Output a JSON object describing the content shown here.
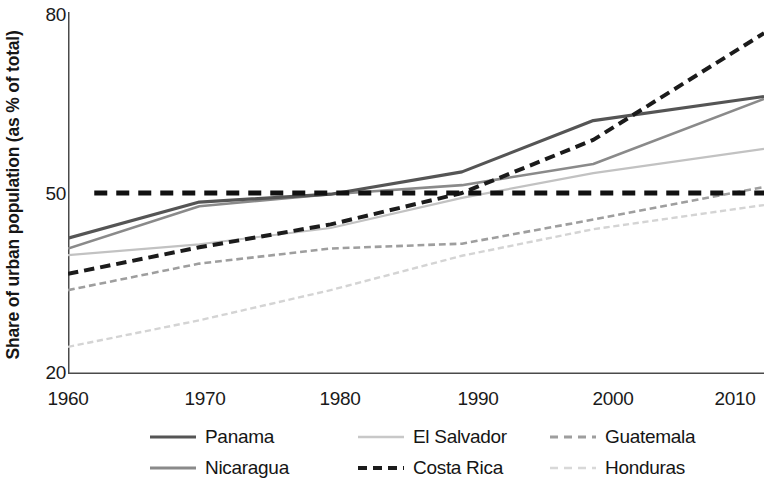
{
  "chart_data": {
    "type": "line",
    "title": "",
    "xlabel": "",
    "ylabel": "Share of urban population (as % of total)",
    "xlim": [
      1960,
      2013
    ],
    "ylim": [
      20,
      80
    ],
    "grid": false,
    "legend_position": "bottom",
    "x_ticks": [
      "1960",
      "1970",
      "1980",
      "1990",
      "2000",
      "2010"
    ],
    "x_tick_values": [
      1960,
      1970,
      1980,
      1990,
      2000,
      2010
    ],
    "y_ticks": [
      "20",
      "50",
      "80"
    ],
    "y_tick_values": [
      20,
      50,
      80
    ],
    "reference_line": {
      "name": "50-percent-reference",
      "value": 50,
      "style": "dashed",
      "color": "#111111",
      "width": 5,
      "x_start": 1962,
      "x_end": 2013
    },
    "x": [
      1960,
      1970,
      1980,
      1990,
      2000,
      2013
    ],
    "series": [
      {
        "name": "Panama",
        "color": "#555555",
        "style": "solid",
        "width": 3.2,
        "values": [
          42.5,
          48.5,
          49.8,
          53.5,
          62.0,
          66.0
        ]
      },
      {
        "name": "Nicaragua",
        "color": "#8a8a8a",
        "style": "solid",
        "width": 2.6,
        "values": [
          40.8,
          47.8,
          49.8,
          51.3,
          54.8,
          65.6
        ]
      },
      {
        "name": "El Salvador",
        "color": "#c2c2c2",
        "style": "solid",
        "width": 2.2,
        "values": [
          39.7,
          41.5,
          44.2,
          49.2,
          53.3,
          57.3
        ]
      },
      {
        "name": "Costa Rica",
        "color": "#1b1b1b",
        "style": "dashed",
        "width": 4.0,
        "values": [
          36.6,
          41.0,
          44.8,
          50.0,
          58.8,
          76.5
        ]
      },
      {
        "name": "Guatemala",
        "color": "#9e9e9e",
        "style": "dashed",
        "width": 2.6,
        "values": [
          33.9,
          38.3,
          40.8,
          41.6,
          45.6,
          51.0
        ]
      },
      {
        "name": "Honduras",
        "color": "#d4d4d4",
        "style": "dashed",
        "width": 2.4,
        "values": [
          24.5,
          28.9,
          33.9,
          39.6,
          44.0,
          48.0
        ]
      }
    ]
  },
  "axis": {
    "y_title": "Share of urban population (as % of total)",
    "y_tick_labels": [
      "80",
      "50",
      "20"
    ],
    "x_tick_labels": [
      "1960",
      "1970",
      "1980",
      "1990",
      "2000",
      "2010"
    ]
  },
  "legend": {
    "rows": [
      [
        {
          "label": "Panama",
          "icon": "solid-line-swatch"
        },
        {
          "label": "El Salvador",
          "icon": "light-solid-line-swatch"
        },
        {
          "label": "Guatemala",
          "icon": "gray-dashed-line-swatch"
        }
      ],
      [
        {
          "label": "Nicaragua",
          "icon": "gray-solid-line-swatch"
        },
        {
          "label": "Costa Rica",
          "icon": "black-dashed-line-swatch"
        },
        {
          "label": "Honduras",
          "icon": "light-dashed-line-swatch"
        }
      ]
    ]
  }
}
